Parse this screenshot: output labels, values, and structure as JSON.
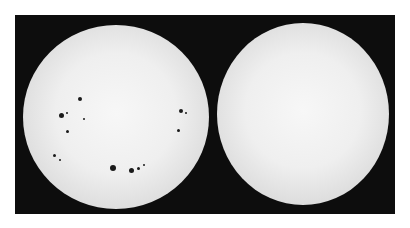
{
  "image": {
    "description": "Two photographs of the Sun side by side on a black background: left disk with sunspots (solar maximum), right disk nearly spotless (solar minimum)",
    "panels": [
      {
        "label": "sun-with-sunspots",
        "sunspot_count_visible": 14
      },
      {
        "label": "sun-without-sunspots",
        "sunspot_count_visible": 0
      }
    ],
    "colors": {
      "background": "#0d0d0d",
      "sun_disk": "#efefef",
      "sunspot": "#1a1a1a"
    }
  },
  "spots": [
    {
      "x": 57,
      "y": 74,
      "r": 2
    },
    {
      "x": 38,
      "y": 90,
      "r": 2.5
    },
    {
      "x": 44,
      "y": 88,
      "r": 1
    },
    {
      "x": 44,
      "y": 106,
      "r": 1.5
    },
    {
      "x": 61,
      "y": 94,
      "r": 1
    },
    {
      "x": 31,
      "y": 130,
      "r": 1.5
    },
    {
      "x": 37,
      "y": 135,
      "r": 1
    },
    {
      "x": 90,
      "y": 143,
      "r": 3
    },
    {
      "x": 108,
      "y": 145,
      "r": 2.5
    },
    {
      "x": 115,
      "y": 143,
      "r": 1.5
    },
    {
      "x": 121,
      "y": 140,
      "r": 1
    },
    {
      "x": 158,
      "y": 86,
      "r": 2
    },
    {
      "x": 163,
      "y": 88,
      "r": 1
    },
    {
      "x": 155,
      "y": 105,
      "r": 1.5
    }
  ]
}
